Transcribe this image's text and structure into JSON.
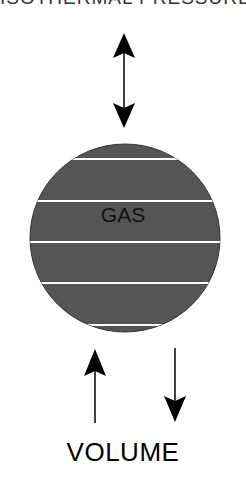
{
  "diagram": {
    "top_text_cropped": "ISOTHERMAL   PRESSURE",
    "gas_label": "GAS",
    "volume_label": "VOLUME",
    "colors": {
      "gas_fill": "#555555",
      "gas_stripes": "#ffffff",
      "arrows": "#000000"
    },
    "elements": [
      {
        "type": "double-arrow",
        "orientation": "vertical",
        "position": "above-gas"
      },
      {
        "type": "ellipse",
        "label": "GAS",
        "stripes": 5
      },
      {
        "type": "arrow",
        "direction": "up",
        "position": "below-gas-left"
      },
      {
        "type": "arrow",
        "direction": "down",
        "position": "below-gas-right"
      }
    ]
  }
}
